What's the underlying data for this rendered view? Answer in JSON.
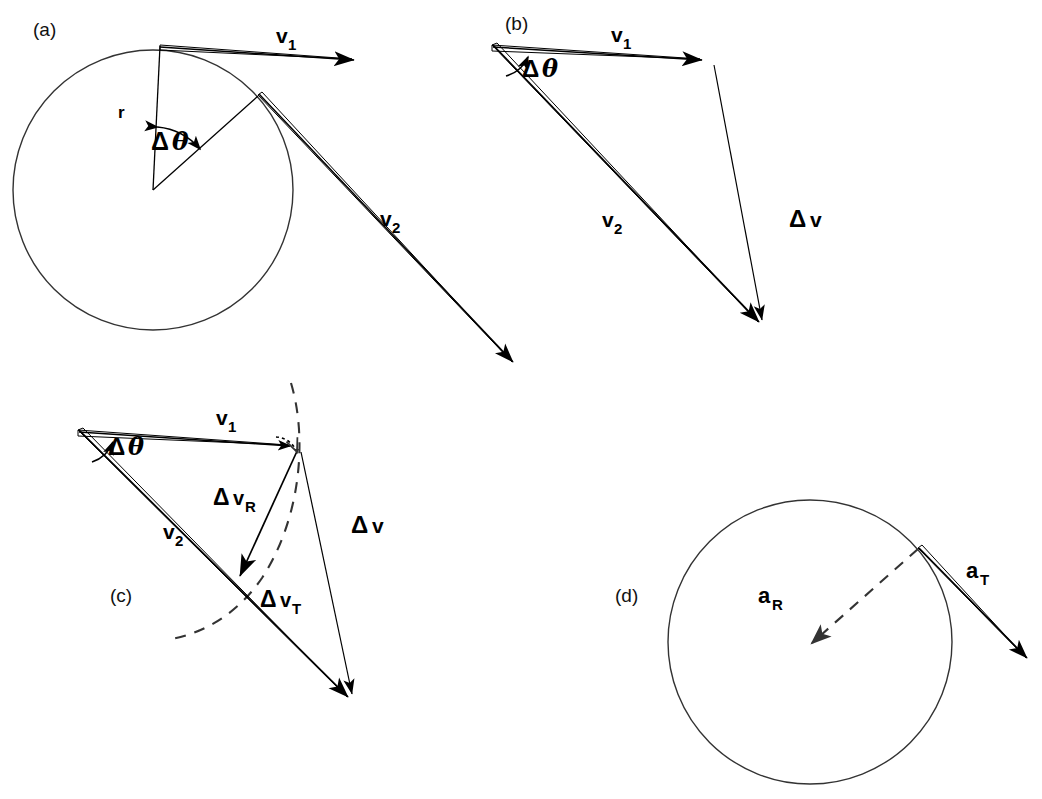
{
  "figure": {
    "background_color": "#ffffff",
    "stroke_color": "#000000",
    "dashed_color": "#333333",
    "width": 1042,
    "height": 799
  },
  "panels": [
    {
      "id": "a",
      "tag": "(a)",
      "tag_x": 33,
      "tag_y": 36,
      "description": "Particle on circular path of radius r; velocity v1 tangent at first position, v2 tangent at second position, separated by central angle delta-theta",
      "circle": {
        "cx": 153,
        "cy": 190,
        "r": 140
      },
      "labels": [
        {
          "name": "radius-label",
          "text": "r",
          "sub": "",
          "x": 118,
          "y": 117,
          "size": 17
        },
        {
          "name": "delta-theta-label",
          "base": "Δ",
          "sym": "θ",
          "x": 152,
          "y": 148,
          "size": 25
        },
        {
          "name": "v1-label",
          "base": "v",
          "sub": "1",
          "x": 277,
          "y": 42,
          "size": 21
        },
        {
          "name": "v2-label",
          "base": "v",
          "sub": "2",
          "x": 382,
          "y": 225,
          "size": 21
        }
      ]
    },
    {
      "id": "b",
      "tag": "(b)",
      "tag_x": 505,
      "tag_y": 30,
      "description": "Vector triangle: v1 and v2 drawn from common origin, delta-v is the vector from tip of v1 to tip of v2",
      "labels": [
        {
          "name": "delta-theta-label",
          "base": "Δ",
          "sym": "θ",
          "x": 524,
          "y": 75,
          "size": 24
        },
        {
          "name": "v1-label",
          "base": "v",
          "sub": "1",
          "x": 613,
          "y": 41,
          "size": 21
        },
        {
          "name": "v2-label",
          "base": "v",
          "sub": "2",
          "x": 604,
          "y": 226,
          "size": 21
        },
        {
          "name": "delta-v-label",
          "base": "Δ",
          "sub2": "v",
          "x": 790,
          "y": 226,
          "size": 24
        }
      ]
    },
    {
      "id": "c",
      "tag": "(c)",
      "tag_x": 110,
      "tag_y": 602,
      "description": "Same vector triangle with delta-v resolved into radial component delta-v-R and tangential component delta-v-T; dashed arc of constant speed",
      "labels": [
        {
          "name": "delta-theta-label",
          "base": "Δ",
          "sym": "θ",
          "x": 110,
          "y": 453,
          "size": 24
        },
        {
          "name": "v1-label",
          "base": "v",
          "sub": "1",
          "x": 218,
          "y": 424,
          "size": 21
        },
        {
          "name": "v2-label",
          "base": "v",
          "sub": "2",
          "x": 165,
          "y": 538,
          "size": 21
        },
        {
          "name": "delta-vR-label",
          "base": "Δ",
          "sub2": "v",
          "sub": "R",
          "x": 215,
          "y": 504,
          "size": 23
        },
        {
          "name": "delta-vT-label",
          "base": "Δ",
          "sub2": "v",
          "sub": "T",
          "x": 262,
          "y": 606,
          "size": 23
        },
        {
          "name": "delta-v-label",
          "base": "Δ",
          "sub2": "v",
          "x": 352,
          "y": 532,
          "size": 24
        }
      ]
    },
    {
      "id": "d",
      "tag": "(d)",
      "tag_x": 615,
      "tag_y": 602,
      "description": "Acceleration components at a point on the circle: radial acceleration a_R points toward the center (dashed), tangential acceleration a_T points along the tangent",
      "circle": {
        "cx": 810,
        "cy": 642,
        "r": 142
      },
      "labels": [
        {
          "name": "aR-label",
          "base": "a",
          "sub": "R",
          "x": 760,
          "y": 602,
          "size": 22
        },
        {
          "name": "aT-label",
          "base": "a",
          "sub": "T",
          "x": 968,
          "y": 577,
          "size": 22
        }
      ]
    }
  ],
  "vectors": {
    "panel_a": {
      "v1": {
        "from": [
          160,
          45
        ],
        "to": [
          368,
          60
        ],
        "label": "v1",
        "style": "solid-thick"
      },
      "v2": {
        "from": [
          258,
          95
        ],
        "to": [
          522,
          371
        ],
        "label": "v2",
        "style": "solid-thick"
      },
      "radius_1": {
        "from": [
          153,
          190
        ],
        "to": [
          160,
          45
        ],
        "label": "r",
        "style": "thin"
      },
      "radius_2": {
        "from": [
          153,
          190
        ],
        "to": [
          258,
          95
        ],
        "label": "",
        "style": "thin"
      }
    },
    "panel_b": {
      "v1": {
        "from": [
          492,
          45
        ],
        "to": [
          710,
          61
        ],
        "label": "v1",
        "style": "solid-thick"
      },
      "v2": {
        "from": [
          492,
          45
        ],
        "to": [
          768,
          332
        ],
        "label": "v2",
        "style": "solid-thick"
      },
      "delta_v": {
        "from": [
          713,
          64
        ],
        "to": [
          766,
          331
        ],
        "label": "Δv",
        "style": "thin"
      }
    },
    "panel_c": {
      "v1": {
        "from": [
          78,
          430
        ],
        "to": [
          297,
          446
        ],
        "label": "v1",
        "style": "solid-thick"
      },
      "v2": {
        "from": [
          78,
          430
        ],
        "to": [
          357,
          706
        ],
        "label": "v2",
        "style": "solid-thick"
      },
      "delta_v": {
        "from": [
          299,
          449
        ],
        "to": [
          356,
          705
        ],
        "label": "Δv",
        "style": "thin"
      },
      "delta_vR": {
        "from": [
          298,
          448
        ],
        "to": [
          238,
          580
        ],
        "label": "ΔvR",
        "style": "thin"
      },
      "delta_vT_note": "ΔvT is the segment of v2 from (238,580) to the arrow tip at (357,706)",
      "dashed_arc": {
        "note": "arc of constant speed through tip of v1, centered at triangle apex"
      }
    },
    "panel_d": {
      "a_R": {
        "from": [
          918,
          548
        ],
        "to": [
          805,
          648
        ],
        "label": "aR",
        "style": "dashed"
      },
      "a_T": {
        "from": [
          918,
          548
        ],
        "to": [
          1036,
          668
        ],
        "label": "aT",
        "style": "solid-thick"
      }
    }
  },
  "text_tokens": {
    "panel_a_tag": "(a)",
    "panel_b_tag": "(b)",
    "panel_c_tag": "(c)",
    "panel_d_tag": "(d)",
    "delta": "Δ",
    "theta": "θ",
    "v": "v",
    "a": "a",
    "r": "r",
    "one": "1",
    "two": "2",
    "R": "R",
    "T": "T"
  }
}
